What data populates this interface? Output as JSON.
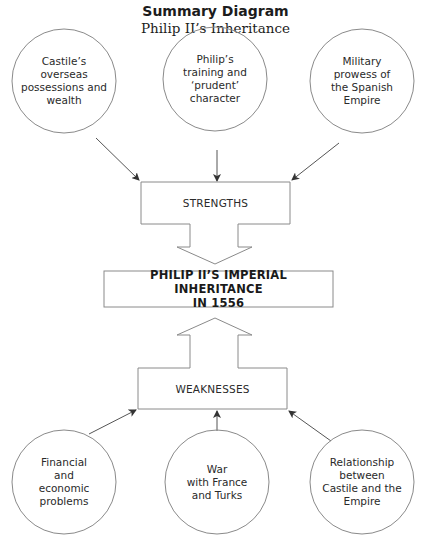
{
  "header": {
    "title": "Summary Diagram",
    "subtitle": "Philip II’s Inheritance"
  },
  "strengths": {
    "label": "STRENGTHS",
    "items": [
      {
        "lines": [
          "Castile’s",
          "overseas",
          "possessions and",
          "wealth"
        ]
      },
      {
        "lines": [
          "Philip’s",
          "training and",
          "‘prudent’",
          "character"
        ]
      },
      {
        "lines": [
          "Military",
          "prowess of",
          "the Spanish",
          "Empire"
        ]
      }
    ]
  },
  "center": {
    "lines": [
      "PHILIP II’S IMPERIAL INHERITANCE",
      "IN 1556"
    ]
  },
  "weaknesses": {
    "label": "WEAKNESSES",
    "items": [
      {
        "lines": [
          "Financial",
          "and",
          "economic",
          "problems"
        ]
      },
      {
        "lines": [
          "War",
          "with France",
          "and Turks"
        ]
      },
      {
        "lines": [
          "Relationship",
          "between",
          "Castile and the",
          "Empire"
        ]
      }
    ]
  },
  "colors": {
    "stroke": "#8a8a8a",
    "arrow": "#333333",
    "text": "#222222"
  }
}
